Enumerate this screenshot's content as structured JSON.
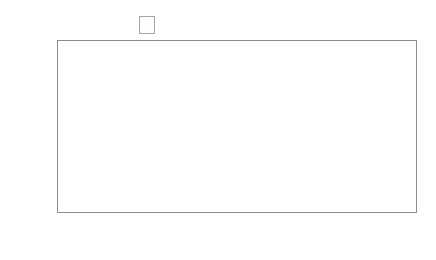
{
  "legend": {
    "position": "top-center",
    "entries": [
      {
        "label": "2012/13",
        "color": "#808080"
      },
      {
        "label": "2013/14",
        "color": "#595959"
      },
      {
        "label": "2014/15",
        "color": "#c8c8c8"
      }
    ]
  },
  "footer": {
    "copyright": "© Higher Education Statistics Agency Limited 2016"
  },
  "axis": {
    "y_ticks": [
      "0",
      "20,000",
      "40,000",
      "60,000",
      "80,000",
      "100,000",
      "120,000",
      "140,000",
      "160,000"
    ]
  },
  "groups": [
    {
      "name": "Full-time",
      "categories": [
        "Academic contract",
        "Non-academic contract"
      ]
    },
    {
      "name": "Part-time",
      "categories": [
        "Academic contract",
        "Non-academic contract"
      ]
    },
    {
      "name": "Atypical",
      "categories": [
        "Academic contract"
      ]
    }
  ],
  "chart_data": {
    "type": "bar",
    "title": "",
    "xlabel": "",
    "ylabel": "",
    "ylim": [
      0,
      160000
    ],
    "ytick_step": 20000,
    "grid": true,
    "legend_position": "top-center",
    "categories": [
      "Full-time – Academic contract",
      "Full-time – Non-academic contract",
      "Part-time – Academic contract",
      "Part-time – Non-academic contract",
      "Atypical – Academic contract"
    ],
    "series": [
      {
        "name": "2012/13",
        "color": "#808080",
        "values": [
          123000,
          132000,
          62000,
          64500,
          72500
        ]
      },
      {
        "name": "2013/14",
        "color": "#595959",
        "values": [
          128500,
          135000,
          64500,
          65500,
          75000
        ]
      },
      {
        "name": "2014/15",
        "color": "#c8c8c8",
        "values": [
          133500,
          139000,
          64000,
          64500,
          76000
        ]
      }
    ]
  }
}
